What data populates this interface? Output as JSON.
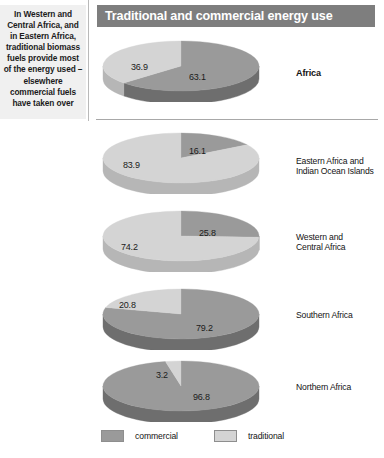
{
  "caption": {
    "text": "In Western and Central Africa, and in Eastern Africa, traditional biomass fuels provide most of the energy used – elsewhere commercial fuels have taken over"
  },
  "title": {
    "text": "Traditional and commercial energy use"
  },
  "legend": {
    "items": [
      {
        "label": "commercial",
        "color": "#9a9a9a"
      },
      {
        "label": "traditional",
        "color": "#d4d4d4"
      }
    ]
  },
  "colors": {
    "commercial_top": "#9a9a9a",
    "commercial_side": "#6e6e6e",
    "traditional_top": "#d4d4d4",
    "traditional_side": "#b6b6b6",
    "title_bar": "#7e7e7e",
    "caption_bg": "#f0f0f0",
    "rule": "#a8a8a8"
  },
  "chart_data": {
    "type": "pie",
    "title": "Traditional and commercial energy use",
    "units": "percent",
    "legend": [
      "commercial",
      "traditional"
    ],
    "legend_position": "bottom",
    "series_names": [
      "commercial",
      "traditional"
    ],
    "charts": [
      {
        "name": "Africa",
        "label": "Africa",
        "emphasis": true,
        "values": [
          63.1,
          36.9
        ],
        "commercial": 63.1,
        "traditional": 36.9,
        "label_commercial": "63.1",
        "label_traditional": "36.9"
      },
      {
        "name": "Eastern Africa and Indian Ocean Islands",
        "label": "Eastern Africa and\nIndian Ocean Islands",
        "emphasis": false,
        "values": [
          16.1,
          83.9
        ],
        "commercial": 16.1,
        "traditional": 83.9,
        "label_commercial": "16.1",
        "label_traditional": "83.9"
      },
      {
        "name": "Western and Central Africa",
        "label": "Western and\nCentral Africa",
        "emphasis": false,
        "values": [
          25.8,
          74.2
        ],
        "commercial": 25.8,
        "traditional": 74.2,
        "label_commercial": "25.8",
        "label_traditional": "74.2"
      },
      {
        "name": "Southern Africa",
        "label": "Southern Africa",
        "emphasis": false,
        "values": [
          79.2,
          20.8
        ],
        "commercial": 79.2,
        "traditional": 20.8,
        "label_commercial": "79.2",
        "label_traditional": "20.8"
      },
      {
        "name": "Northern Africa",
        "label": "Northern Africa",
        "emphasis": false,
        "values": [
          96.8,
          3.2
        ],
        "commercial": 96.8,
        "traditional": 3.2,
        "label_commercial": "96.8",
        "label_traditional": "3.2"
      }
    ]
  }
}
